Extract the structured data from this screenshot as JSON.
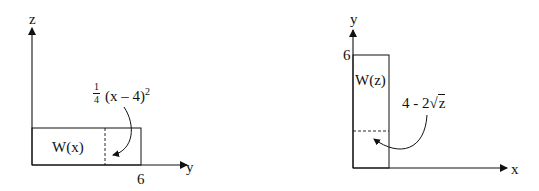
{
  "left_diagram": {
    "vertical_axis_label": "z",
    "horizontal_axis_label": "y",
    "tick_label": "6",
    "region_label": "W(x)",
    "boundary_expression": {
      "coefficient_numerator": "1",
      "coefficient_denominator": "4",
      "body": "(x – 4)",
      "exponent": "2"
    }
  },
  "right_diagram": {
    "vertical_axis_label": "y",
    "horizontal_axis_label": "x",
    "tick_label": "6",
    "region_label": "W(z)",
    "boundary_expression": {
      "prefix": "4 - 2",
      "radical_symbol": "√",
      "radicand": "z"
    }
  }
}
